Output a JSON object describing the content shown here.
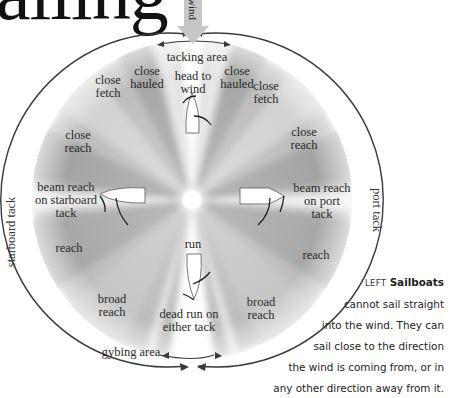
{
  "title": "ailing",
  "wind_label": "wind",
  "diagram": {
    "top_area_label": "tacking area",
    "bottom_area_label": "gybing area",
    "left_side_label": "starboard tack",
    "right_side_label": "port tack",
    "points_of_sail": [
      {
        "id": "head-to-wind",
        "lines": [
          "head to",
          "wind"
        ]
      },
      {
        "id": "close-hauled-left",
        "lines": [
          "close",
          "hauled"
        ]
      },
      {
        "id": "close-hauled-right",
        "lines": [
          "close",
          "hauled"
        ]
      },
      {
        "id": "close-fetch-left",
        "lines": [
          "close",
          "fetch"
        ]
      },
      {
        "id": "close-fetch-right",
        "lines": [
          "close",
          "fetch"
        ]
      },
      {
        "id": "close-reach-left",
        "lines": [
          "close",
          "reach"
        ]
      },
      {
        "id": "close-reach-right",
        "lines": [
          "close",
          "reach"
        ]
      },
      {
        "id": "beam-reach-starboard",
        "lines": [
          "beam reach",
          "on starboard",
          "tack"
        ]
      },
      {
        "id": "beam-reach-port",
        "lines": [
          "beam reach",
          "on port",
          "tack"
        ]
      },
      {
        "id": "reach-left",
        "lines": [
          "reach"
        ]
      },
      {
        "id": "reach-right",
        "lines": [
          "reach"
        ]
      },
      {
        "id": "broad-reach-left",
        "lines": [
          "broad",
          "reach"
        ]
      },
      {
        "id": "broad-reach-right",
        "lines": [
          "broad",
          "reach"
        ]
      },
      {
        "id": "run",
        "lines": [
          "run"
        ]
      },
      {
        "id": "dead-run",
        "lines": [
          "dead run on",
          "either tack"
        ]
      }
    ],
    "colors": {
      "wedge_dark": "#a9a9a9",
      "wedge_light": "#cfcfcf",
      "circle_stroke": "#3a3a3a",
      "wind_arrow": "#c4c4c4",
      "boat_fill": "#ffffff"
    }
  },
  "caption": {
    "lead": "LEFT",
    "lines": [
      "Sailboats",
      "cannot sail straight",
      "into the wind. They can",
      "sail close to the direction",
      "the wind is coming from, or in",
      "any other direction away from it."
    ]
  }
}
